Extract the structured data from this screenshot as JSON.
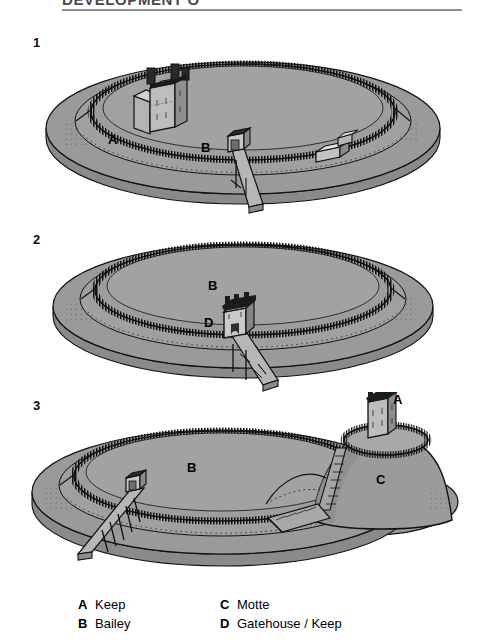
{
  "header": {
    "title": "DEVELOPMENT O",
    "rule": true
  },
  "steps": [
    {
      "number": "1"
    },
    {
      "number": "2"
    },
    {
      "number": "3"
    }
  ],
  "figure_labels": {
    "d1_keep": "A",
    "d1_bailey": "B",
    "d2_bailey": "B",
    "d2_gatehouse": "D",
    "d3_keep": "A",
    "d3_bailey": "B",
    "d3_motte": "C"
  },
  "legend": {
    "column_one": [
      {
        "key": "A",
        "text": "Keep"
      },
      {
        "key": "B",
        "text": "Bailey"
      }
    ],
    "column_two": [
      {
        "key": "C",
        "text": "Motte"
      },
      {
        "key": "D",
        "text": "Gatehouse / Keep"
      }
    ]
  },
  "colors": {
    "earth_fill": "#9a9a9a",
    "earth_fill_light": "#a6a6a6",
    "earth_fill_dark": "#8a8a8a",
    "outline": "#111111",
    "page_background": "#ffffff",
    "header_rule": "#8d8d8d",
    "header_text": "#4a4a4a"
  },
  "diagram_1": {
    "caption_number": "1",
    "description": "Oval ringwork earthwork enclosure with outer bank and ditch, timber palisade on the inner rampart, a stone keep at the upper left of the bailey, a hall building at the right, and a gate with a timber bridge crossing the ditch at the lower centre.",
    "elements": [
      "ringwork",
      "palisade",
      "stone-keep",
      "hall-building",
      "gate",
      "timber-bridge",
      "ditch"
    ]
  },
  "diagram_2": {
    "caption_number": "2",
    "description": "The same oval ringwork enclosure, now empty of internal buildings, with a large crenellated gatehouse keep set astride the rampart at the lower centre and a long timber bridge on trestle posts running down across the ditch.",
    "elements": [
      "ringwork",
      "palisade",
      "gatehouse-keep",
      "trestle-bridge",
      "ditch"
    ]
  },
  "diagram_3": {
    "caption_number": "3",
    "description": "The oval bailey enclosure with a tall conical motte raised at the right end, ringed by its own palisade and crowned by a stone keep, reached by a flight of steps; a gate with a trestle bridge stands at the lower left of the bailey.",
    "elements": [
      "bailey",
      "palisade",
      "motte",
      "motte-palisade",
      "stone-keep",
      "motte-steps",
      "gate",
      "trestle-bridge",
      "ditch"
    ]
  }
}
